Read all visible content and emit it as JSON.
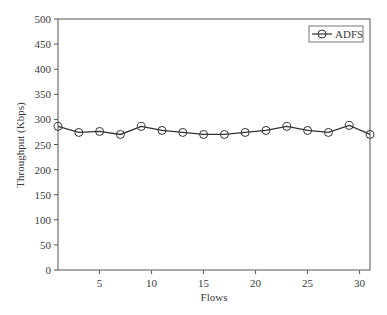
{
  "chart_data": {
    "type": "line",
    "title": "",
    "xlabel": "Flows",
    "ylabel": "Throughput (Kbps)",
    "xlim": [
      1,
      31
    ],
    "ylim": [
      0,
      500
    ],
    "xticks": [
      5,
      10,
      15,
      20,
      25,
      30
    ],
    "yticks": [
      0,
      50,
      100,
      150,
      200,
      250,
      300,
      350,
      400,
      450,
      500
    ],
    "grid": false,
    "legend_position": "upper right",
    "x": [
      1,
      3,
      5,
      7,
      9,
      11,
      13,
      15,
      17,
      19,
      21,
      23,
      25,
      27,
      29,
      31
    ],
    "series": [
      {
        "name": "ADFS",
        "marker": "open-circle",
        "color": "#333333",
        "values": [
          286,
          274,
          276,
          270,
          286,
          278,
          274,
          270,
          270,
          274,
          278,
          286,
          278,
          274,
          288,
          270
        ]
      }
    ]
  }
}
